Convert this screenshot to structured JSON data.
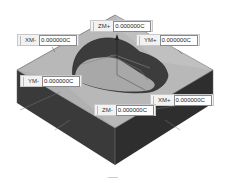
{
  "viewport": {
    "description": "Isometric 3D view of a rectangular block with a heart-like pocket and dimension handles",
    "colors": {
      "top_face": "#b4b4b4",
      "side_face_left": "#3a3a3a",
      "side_face_right": "#2e2e2e",
      "pocket_wall": "#3c3c3c",
      "pocket_floor": "#a8a8a8",
      "background": "#ffffff"
    }
  },
  "dimension_handles": [
    {
      "id": "zm-plus",
      "label": "ZM+",
      "value": "0.000000C"
    },
    {
      "id": "xm-minus",
      "label": "XM-",
      "value": "0.000000C"
    },
    {
      "id": "ym-plus",
      "label": "YM+",
      "value": "0.000000C"
    },
    {
      "id": "ym-minus",
      "label": "YM-",
      "value": "0.000000C"
    },
    {
      "id": "xm-plus",
      "label": "XM+",
      "value": "0.000000C"
    },
    {
      "id": "zm-minus",
      "label": "ZM-",
      "value": "0.000000C"
    }
  ]
}
